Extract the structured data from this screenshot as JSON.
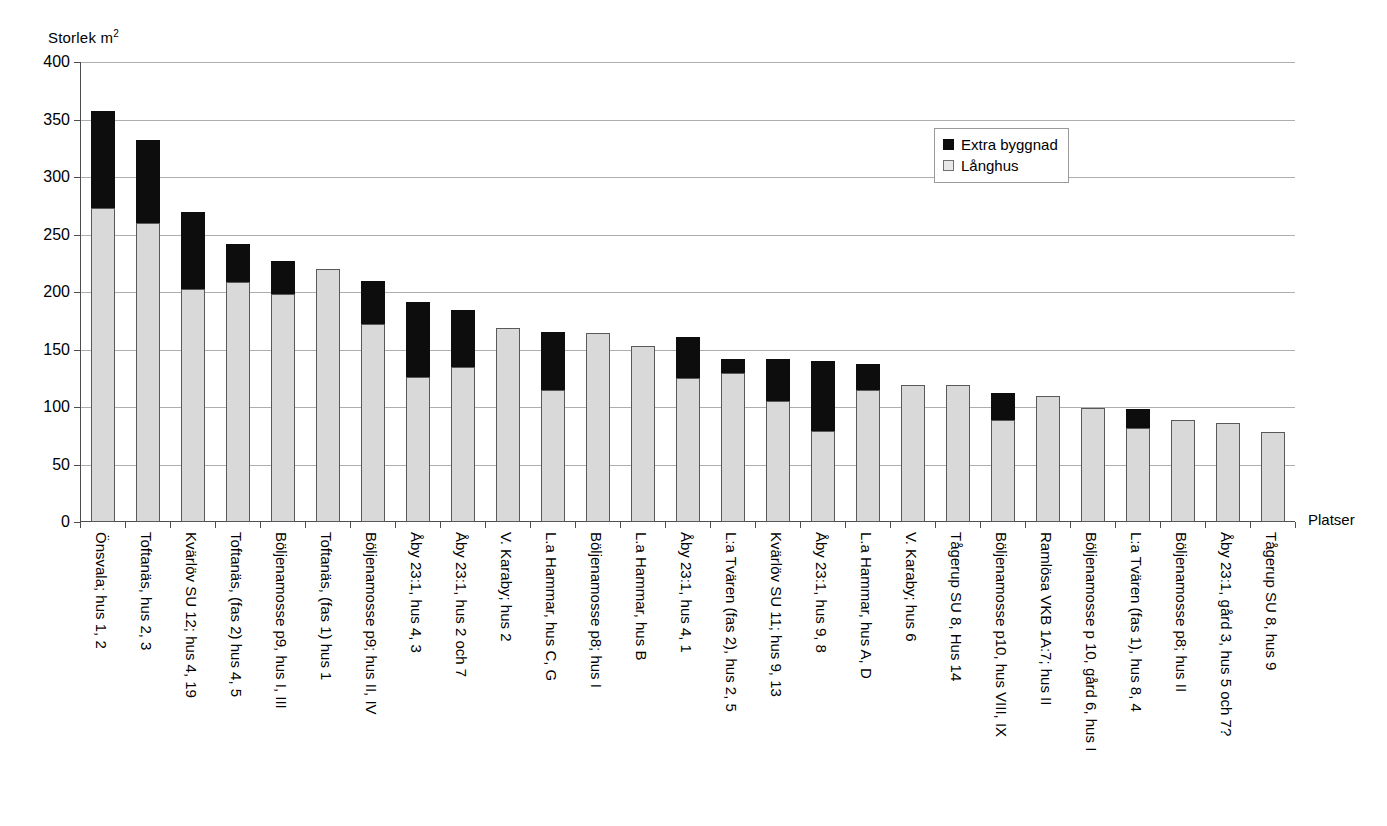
{
  "chart_data": {
    "type": "bar",
    "stacked": true,
    "title": "",
    "ylabel": "Storlek m²",
    "xlabel": "Platser",
    "ylim": [
      0,
      400
    ],
    "ytick_step": 50,
    "yticks": [
      "400",
      "350",
      "300",
      "250",
      "200",
      "150",
      "100",
      "50",
      "0"
    ],
    "grid": "horizontal",
    "legend_position": "top-right",
    "colors": {
      "extra_byggnad": "#0d0d0d",
      "langhus": "#d9d9d9",
      "gridline": "#aeaeae",
      "axis": "#4d4d4d"
    },
    "series": [
      {
        "name": "Extra byggnad",
        "values": [
          84,
          72,
          67,
          33,
          29,
          0,
          38,
          65,
          49,
          0,
          50,
          0,
          0,
          36,
          12,
          37,
          61,
          22,
          0,
          0,
          23,
          0,
          0,
          16,
          0,
          0,
          0
        ]
      },
      {
        "name": "Långhus",
        "values": [
          273,
          260,
          203,
          209,
          198,
          220,
          172,
          126,
          135,
          169,
          115,
          164,
          153,
          125,
          130,
          105,
          79,
          115,
          119,
          119,
          89,
          110,
          99,
          82,
          89,
          86,
          78
        ]
      }
    ],
    "totals": [
      357,
      332,
      270,
      242,
      227,
      220,
      210,
      191,
      184,
      169,
      165,
      164,
      153,
      161,
      142,
      142,
      140,
      137,
      119,
      119,
      112,
      110,
      99,
      98,
      89,
      86,
      78
    ],
    "categories": [
      "Önsvala; hus 1, 2",
      "Toftanäs, hus 2, 3",
      "Kvärlöv SU 12; hus 4, 19",
      "Toftanäs, (fas 2) hus 4, 5",
      "Böljenamosse p9, hus I, III",
      "Toftanäs, (fas 1) hus 1",
      "Böljenamosse p9; hus II, IV",
      "Åby 23:1, hus 4, 3",
      "Åby 23:1, hus 2 och 7",
      "V. Karaby; hus 2",
      "L.a Hammar, hus C, G",
      "Böljenamosse p8; hus I",
      "L.a Hammar, hus B",
      "Åby 23:1, hus 4, 1",
      "L:a Tvären (fas 2), hus 2, 5",
      "Kvärlöv SU 11; hus 9, 13",
      "Åby 23:1, hus 9, 8",
      "L.a Hammar, hus A, D",
      "V. Karaby; hus 6",
      "Tågerup SU 8, Hus 14",
      "Böljenamosse p10, hus VIII, IX",
      "Ramlösa VKB 1A:7; hus II",
      "Böljenamosse p 10, gård 6, hus I",
      "L:a Tvären (fas 1), hus 8, 4",
      "Böljenamosse p8; hus II",
      "Åby 23:1, gård 3, hus 5 och 7?",
      "Tågerup SU 8, hus 9"
    ]
  },
  "legend": {
    "items": [
      {
        "label": "Extra byggnad",
        "swatch": "black-square-icon"
      },
      {
        "label": "Långhus",
        "swatch": "gray-square-icon"
      }
    ]
  },
  "axes": {
    "y_title_text": "Storlek m",
    "y_title_sup": "2",
    "x_title": "Platser"
  }
}
